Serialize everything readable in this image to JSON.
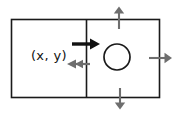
{
  "diagram": {
    "background_color": "#ffffff",
    "outline_color": "#1a1a1a",
    "arrow_gray": "#6e6e6e",
    "arrow_black": "#111111",
    "labels": {
      "coordinate": "(x, y)"
    },
    "shapes": {
      "outer_rectangle": {
        "name": "outer-rectangle",
        "x": 11,
        "y": 19,
        "width": 149,
        "height": 79
      },
      "divider_line": {
        "name": "cell-divider",
        "x": 86,
        "y1": 19,
        "y2": 98
      },
      "circle": {
        "name": "circle-marker",
        "cx": 117,
        "cy": 57,
        "r": 13
      }
    },
    "arrows": [
      {
        "name": "inner-right-arrow",
        "direction": "right",
        "style": "bold",
        "color": "#111111",
        "from_x": 72,
        "to_x": 98,
        "y": 44
      },
      {
        "name": "inner-left-arrow",
        "direction": "left",
        "style": "double-chevron",
        "color": "#6e6e6e",
        "from_x": 89,
        "to_x": 68,
        "y": 64
      },
      {
        "name": "outer-up-arrow",
        "direction": "up",
        "style": "plain",
        "color": "#6e6e6e",
        "x": 119,
        "from_y": 29,
        "to_y": 7
      },
      {
        "name": "outer-right-arrow",
        "direction": "right",
        "style": "plain",
        "color": "#6e6e6e",
        "y": 58,
        "from_x": 149,
        "to_x": 173
      },
      {
        "name": "outer-down-arrow",
        "direction": "down",
        "style": "plain",
        "color": "#6e6e6e",
        "x": 120,
        "from_y": 88,
        "to_y": 110
      }
    ]
  }
}
